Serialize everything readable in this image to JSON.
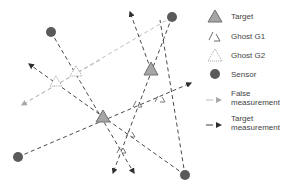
{
  "legend": {
    "target": "Target",
    "ghost_g1": "Ghost G1",
    "ghost_g2": "Ghost G2",
    "sensor": "Sensor",
    "false_measurement": "False measurement",
    "target_measurement": "Target measurement"
  },
  "colors": {
    "sensor": "#5a5a5a",
    "target_fill": "#a6a6a6",
    "target_stroke": "#707070",
    "false_line": "#bdbdbd",
    "target_line": "#3f3f3f",
    "text": "#444444"
  },
  "nodes": {
    "sensors": [
      {
        "x": 51,
        "y": 32
      },
      {
        "x": 172,
        "y": 17
      },
      {
        "x": 18,
        "y": 157
      },
      {
        "x": 185,
        "y": 175
      }
    ],
    "targets": [
      {
        "x": 151,
        "y": 70
      },
      {
        "x": 103,
        "y": 117
      }
    ],
    "ghost_g2": [
      {
        "x": 76,
        "y": 72
      },
      {
        "x": 56,
        "y": 82
      }
    ],
    "ghost_g1": [
      {
        "x": 160,
        "y": 99
      },
      {
        "x": 136,
        "y": 105
      },
      {
        "x": 131,
        "y": 134
      },
      {
        "x": 122,
        "y": 150
      }
    ]
  }
}
